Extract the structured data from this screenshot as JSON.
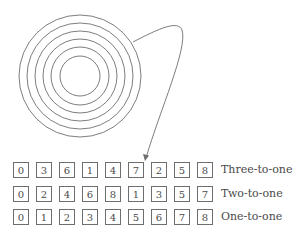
{
  "diagram": {
    "circles": {
      "cx": 80,
      "cy": 76,
      "radii": [
        61,
        53,
        45,
        37,
        29,
        20
      ],
      "stroke": "#6e6e6e"
    },
    "arrow": {
      "path": "M 133 42 C 160 28, 178 20, 182 30 C 188 48, 160 110, 146 158",
      "target_row": 0,
      "target_index": 5,
      "stroke": "#6e6e6e"
    },
    "rows": [
      {
        "label": "Three-to-one",
        "values": [
          "0",
          "3",
          "6",
          "1",
          "4",
          "7",
          "2",
          "5",
          "8"
        ]
      },
      {
        "label": "Two-to-one",
        "values": [
          "0",
          "2",
          "4",
          "6",
          "8",
          "1",
          "3",
          "5",
          "7"
        ]
      },
      {
        "label": "One-to-one",
        "values": [
          "0",
          "1",
          "2",
          "3",
          "4",
          "5",
          "6",
          "7",
          "8"
        ]
      }
    ]
  }
}
